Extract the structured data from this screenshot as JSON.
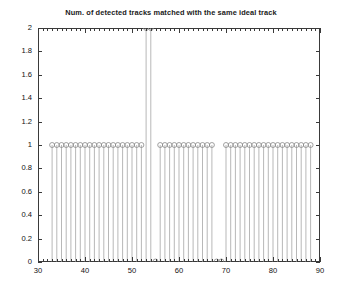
{
  "chart_data": {
    "type": "scatter",
    "plot_style": "stem",
    "title": "Num. of detected tracks matched with the same ideal track",
    "xlabel": "",
    "ylabel": "",
    "xlim": [
      30,
      90
    ],
    "ylim": [
      0,
      2
    ],
    "xticks": [
      30,
      40,
      50,
      60,
      70,
      80,
      90
    ],
    "xtick_labels": [
      "30",
      "40",
      "50",
      "60",
      "70",
      "80",
      "90"
    ],
    "yticks": [
      0,
      0.2,
      0.4,
      0.6,
      0.8,
      1,
      1.2,
      1.4,
      1.6,
      1.8,
      2
    ],
    "ytick_labels": [
      "0",
      "0.2",
      "0.4",
      "0.6",
      "0.8",
      "1",
      "1.2",
      "1.4",
      "1.6",
      "1.8",
      "2"
    ],
    "x_minor_tick_step": 1,
    "grid": false,
    "legend": null,
    "marker": "open-circle",
    "marker_color": "#8a8a8a",
    "stem_color": "#9a9a9a",
    "axis_color": "#3a3a3a",
    "x": [
      33,
      34,
      35,
      36,
      37,
      38,
      39,
      40,
      41,
      42,
      43,
      44,
      45,
      46,
      47,
      48,
      49,
      50,
      51,
      52,
      53,
      54,
      55,
      56,
      57,
      58,
      59,
      60,
      61,
      62,
      63,
      64,
      65,
      66,
      67,
      68,
      69,
      70,
      71,
      72,
      73,
      74,
      75,
      76,
      77,
      78,
      79,
      80,
      81,
      82,
      83,
      84,
      85,
      86,
      87,
      88
    ],
    "values": [
      1,
      1,
      1,
      1,
      1,
      1,
      1,
      1,
      1,
      1,
      1,
      1,
      1,
      1,
      1,
      1,
      1,
      1,
      1,
      1,
      2,
      2,
      0,
      1,
      1,
      1,
      1,
      1,
      1,
      1,
      1,
      1,
      1,
      1,
      1,
      0,
      0,
      1,
      1,
      1,
      1,
      1,
      1,
      1,
      1,
      1,
      1,
      1,
      1,
      1,
      1,
      1,
      1,
      1,
      1,
      1
    ]
  }
}
